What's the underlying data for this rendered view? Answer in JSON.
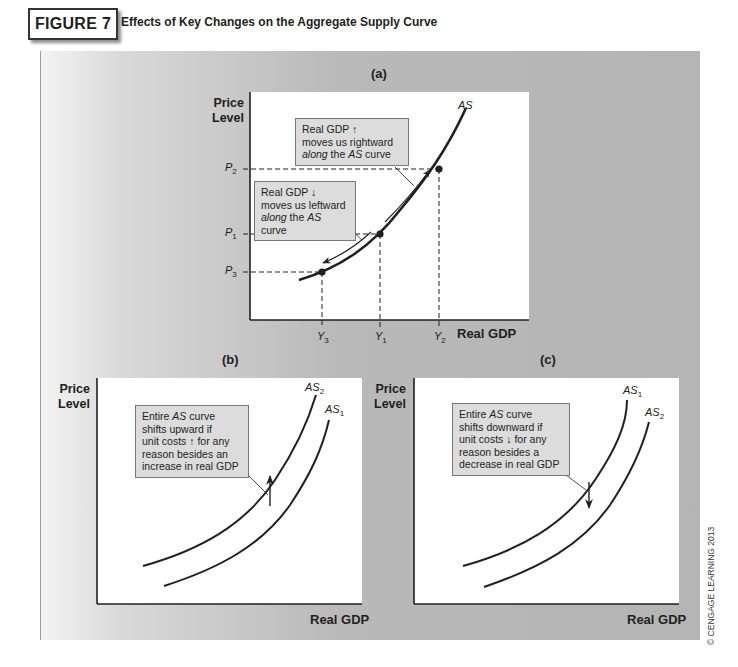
{
  "figure": {
    "label": "FIGURE 7",
    "title": "Effects of Key Changes on the Aggregate Supply Curve",
    "copyright": "© CENGAGE LEARNING 2013",
    "colors": {
      "panel_gray": "#b4b4b4",
      "note_bg": "#dcdcdc",
      "curve": "#231f20"
    }
  },
  "panel_a": {
    "caption": "(a)",
    "ylabel_line1": "Price",
    "ylabel_line2": "Level",
    "xlabel": "Real GDP",
    "curve_label": "AS",
    "y_ticks": [
      {
        "base": "P",
        "sub": "2"
      },
      {
        "base": "P",
        "sub": "1"
      },
      {
        "base": "P",
        "sub": "3"
      }
    ],
    "x_ticks": [
      {
        "base": "Y",
        "sub": "3"
      },
      {
        "base": "Y",
        "sub": "1"
      },
      {
        "base": "Y",
        "sub": "2"
      }
    ],
    "note_up": {
      "line1": "Real GDP ↑",
      "line2": "moves us rightward",
      "line3_italic": "along",
      "line3_rest": " the ",
      "line3_as": "AS",
      "line3_end": " curve"
    },
    "note_down": {
      "line1": "Real GDP ↓",
      "line2": "moves us leftward",
      "line3_italic": "along",
      "line3_rest": " the ",
      "line3_as": "AS",
      "line3_end": " curve"
    }
  },
  "panel_b": {
    "caption": "(b)",
    "ylabel_line1": "Price",
    "ylabel_line2": "Level",
    "xlabel": "Real GDP",
    "curve_upper": {
      "base": "AS",
      "sub": "2"
    },
    "curve_lower": {
      "base": "AS",
      "sub": "1"
    },
    "note": {
      "l1a": "Entire ",
      "l1b": "AS",
      "l1c": " curve",
      "l2": "shifts upward if",
      "l3": "unit costs ↑ for any",
      "l4": "reason besides an",
      "l5": "increase in real GDP"
    }
  },
  "panel_c": {
    "caption": "(c)",
    "ylabel_line1": "Price",
    "ylabel_line2": "Level",
    "xlabel": "Real GDP",
    "curve_upper": {
      "base": "AS",
      "sub": "1"
    },
    "curve_lower": {
      "base": "AS",
      "sub": "2"
    },
    "note": {
      "l1a": "Entire ",
      "l1b": "AS",
      "l1c": " curve",
      "l2": "shifts downward if",
      "l3": "unit costs ↓ for any",
      "l4": "reason besides a",
      "l5": "decrease in real GDP"
    }
  }
}
